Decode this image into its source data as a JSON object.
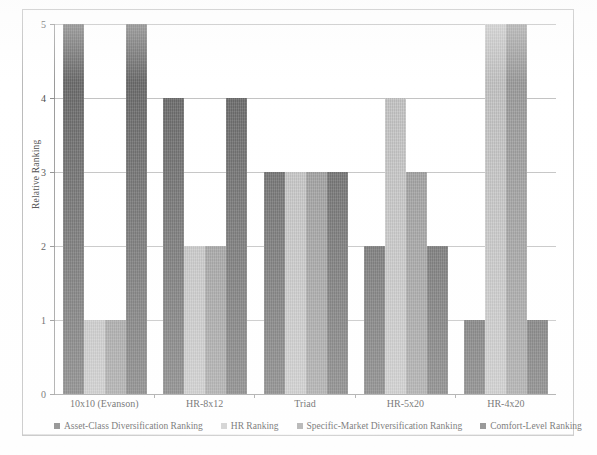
{
  "chart_data": {
    "type": "bar",
    "title": "",
    "xlabel": "",
    "ylabel": "Relative Ranking",
    "ylim": [
      0,
      5
    ],
    "yticks": [
      0,
      1,
      2,
      3,
      4,
      5
    ],
    "grid": true,
    "legend_position": "bottom",
    "categories": [
      "10x10 (Evanson)",
      "HR-8x12",
      "Triad",
      "HR-5x20",
      "HR-4x20"
    ],
    "series": [
      {
        "name": "Asset-Class Diversification Ranking",
        "color": "#6b6b6b",
        "values": [
          5,
          4,
          3,
          2,
          1
        ]
      },
      {
        "name": "HR Ranking",
        "color": "#c4c4c4",
        "values": [
          1,
          2,
          3,
          4,
          5
        ]
      },
      {
        "name": "Specific-Market Diversification Ranking",
        "color": "#9c9c9c",
        "values": [
          1,
          2,
          3,
          3,
          5
        ]
      },
      {
        "name": "Comfort-Level Ranking",
        "color": "#6b6b6b",
        "values": [
          5,
          4,
          3,
          2,
          1
        ]
      }
    ]
  }
}
